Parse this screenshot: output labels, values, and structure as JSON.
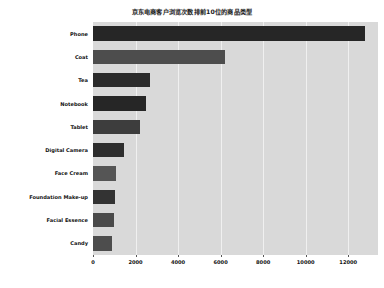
{
  "chart_data": {
    "type": "bar",
    "orientation": "horizontal",
    "title": "京东电商客户浏览次数排前10位的商品类型",
    "xlabel": "",
    "ylabel": "",
    "categories": [
      "Phone",
      "Coat",
      "Tea",
      "Notebook",
      "Tablet",
      "Digital Camera",
      "Face Cream",
      "Foundation Make-up",
      "Facial Essence",
      "Candy"
    ],
    "values": [
      12800,
      6200,
      2700,
      2500,
      2200,
      1450,
      1100,
      1050,
      1000,
      900
    ],
    "xlim": [
      0,
      13400
    ],
    "ylim": [
      0,
      10
    ],
    "xticks": [
      0,
      2000,
      4000,
      6000,
      8000,
      10000,
      12000
    ],
    "xtick_labels": [
      "0",
      "2000",
      "4000",
      "6000",
      "8000",
      "10000",
      "12000"
    ],
    "grid": true,
    "legend": null,
    "bar_colors": [
      "#262626",
      "#4d4d4d",
      "#2b2b2b",
      "#262626",
      "#3d3d3d",
      "#2e2e2e",
      "#555555",
      "#333333",
      "#4a4a4a",
      "#4d4d4d"
    ],
    "plot_background": "#d9d9d9",
    "grid_color": "#f0f0f0",
    "figure_background": "#ffffff",
    "text_color": "#111111"
  }
}
